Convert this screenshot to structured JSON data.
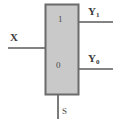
{
  "diagram": {
    "type": "demultiplexer-logic-diagram",
    "body": {
      "fill_color": "#c9c9c9",
      "stroke_color": "#6b6b6b"
    },
    "wire_color": "#5a5a5a",
    "inputs": [
      {
        "id": "data-input",
        "label": "X",
        "side": "left",
        "y": 48
      },
      {
        "id": "select-input",
        "label": "S",
        "side": "bottom",
        "x": 58
      }
    ],
    "outputs": [
      {
        "id": "output-1",
        "label": "Y",
        "subscript": "1",
        "side": "right",
        "y": 22
      },
      {
        "id": "output-0",
        "label": "Y",
        "subscript": "0",
        "side": "right",
        "y": 69
      }
    ],
    "internal_labels": [
      {
        "id": "channel-1",
        "label": "1"
      },
      {
        "id": "channel-0",
        "label": "0"
      }
    ]
  }
}
